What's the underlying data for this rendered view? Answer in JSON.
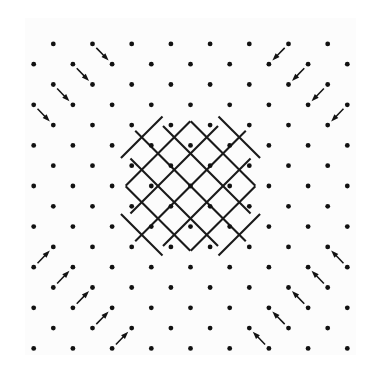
{
  "figure": {
    "title": "",
    "caption": "",
    "background_color": "#ffffff",
    "plot_background_color": "#fcfcfc",
    "ink_color": "#111111",
    "width": 381,
    "height": 373
  },
  "chart_data": {
    "type": "scatter",
    "title": "",
    "subtitle": "",
    "xlabel": "",
    "ylabel": "",
    "xlim": [
      0,
      381
    ],
    "ylim": [
      0,
      373
    ],
    "grid": false,
    "legend_position": "none",
    "annotations": [],
    "lattice": {
      "center_x": 190.5,
      "center_y": 186.0,
      "step_x": 39.2,
      "step_y": 40.6,
      "half_step_x": 19.6,
      "half_step_y": 20.3,
      "columns_per_row": 9,
      "rows": 9,
      "dot_radius": 2.4,
      "dot_color": "#111111"
    },
    "diamond_grid": {
      "half_extent": 95,
      "line_count_per_direction": 7,
      "line_spacing": 23.0,
      "line_color": "#1a1a1a",
      "line_width": 2.1,
      "overhang": 11,
      "orientation_degrees": 45
    },
    "arrow_ring": {
      "count": 48,
      "length": 27,
      "head_length": 7.5,
      "head_width": 5.4,
      "shaft_width": 1.5,
      "color": "#121212",
      "direction": "inward-toward-boundary"
    }
  }
}
